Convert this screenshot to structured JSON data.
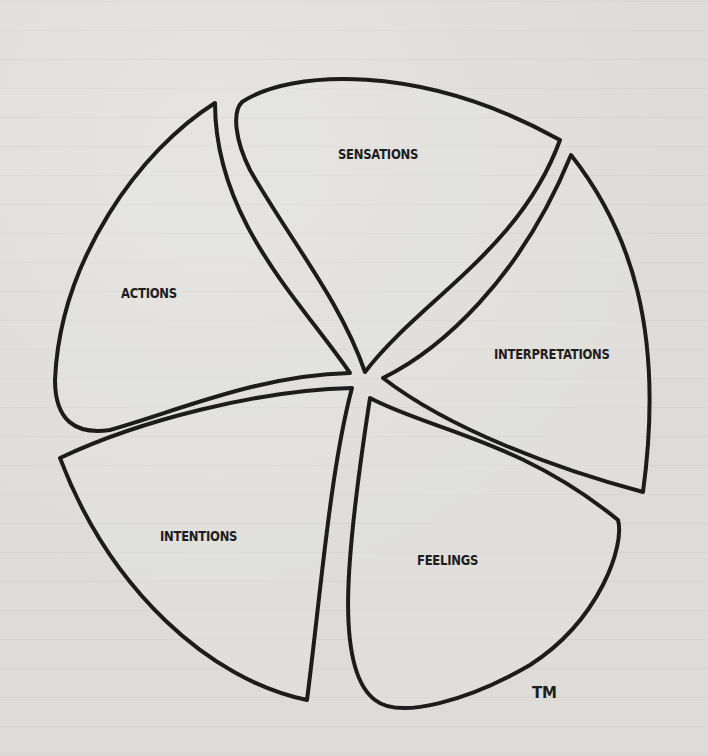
{
  "diagram": {
    "type": "five-petal wheel",
    "segments": [
      {
        "id": "sensations",
        "label": "SENSATIONS"
      },
      {
        "id": "interpretations",
        "label": "INTERPRETATIONS"
      },
      {
        "id": "feelings",
        "label": "FEELINGS"
      },
      {
        "id": "intentions",
        "label": "INTENTIONS"
      },
      {
        "id": "actions",
        "label": "ACTIONS"
      }
    ],
    "trademark": "TM",
    "colors": {
      "paper": "#dddcd8",
      "ink": "#1c1c1c"
    }
  }
}
